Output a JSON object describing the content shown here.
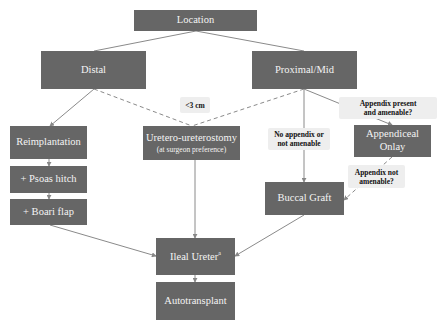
{
  "diagram": {
    "type": "flowchart",
    "colors": {
      "node_fill": "#666666",
      "node_text": "#f4f4f4",
      "label_fill": "#eeeeee",
      "edge": "#888888"
    },
    "nodes": {
      "location": {
        "label": "Location"
      },
      "distal": {
        "label": "Distal"
      },
      "proximal_mid": {
        "label": "Proximal/Mid"
      },
      "reimplantation": {
        "label": "Reimplantation"
      },
      "psoas_hitch": {
        "label": "+ Psoas hitch"
      },
      "boari_flap": {
        "label": "+ Boari flap"
      },
      "uretero_ureterostomy": {
        "label": "Uretero-ureterostomy",
        "sublabel": "(at surgeon preference)"
      },
      "appendiceal_onlay": {
        "label_line1": "Appendiceal",
        "label_line2": "Onlay"
      },
      "buccal_graft": {
        "label": "Buccal Graft"
      },
      "ileal_ureter": {
        "label": "Ileal Ureter",
        "superscript": "a"
      },
      "autotransplant": {
        "label": "Autotransplant"
      }
    },
    "edge_labels": {
      "lt3cm": {
        "text": "<3 cm"
      },
      "appendix_present": {
        "line1": "Appendix present",
        "line2": "and amenable?"
      },
      "no_appendix": {
        "line1": "No appendix or",
        "line2": "not amenable"
      },
      "appendix_not_amenable": {
        "line1": "Appendix not",
        "line2": "amenable?"
      }
    },
    "edges": [
      {
        "from": "Location",
        "to": "Distal",
        "style": "solid"
      },
      {
        "from": "Location",
        "to": "Proximal/Mid",
        "style": "solid"
      },
      {
        "from": "Distal",
        "to": "Reimplantation",
        "style": "solid"
      },
      {
        "from": "Distal",
        "to": "Uretero-ureterostomy",
        "style": "dashed",
        "label": "<3 cm"
      },
      {
        "from": "Proximal/Mid",
        "to": "Uretero-ureterostomy",
        "style": "dashed",
        "label": "<3 cm"
      },
      {
        "from": "Proximal/Mid",
        "to": "Appendiceal Onlay",
        "style": "solid",
        "label": "Appendix present and amenable?"
      },
      {
        "from": "Proximal/Mid",
        "to": "Buccal Graft",
        "style": "solid",
        "label": "No appendix or not amenable"
      },
      {
        "from": "Appendiceal Onlay",
        "to": "Buccal Graft",
        "style": "dashed",
        "label": "Appendix not amenable?"
      },
      {
        "from": "Reimplantation",
        "to": "+ Psoas hitch",
        "style": "solid"
      },
      {
        "from": "+ Psoas hitch",
        "to": "+ Boari flap",
        "style": "solid"
      },
      {
        "from": "+ Boari flap",
        "to": "Ileal Ureter",
        "style": "solid"
      },
      {
        "from": "Uretero-ureterostomy",
        "to": "Ileal Ureter",
        "style": "solid"
      },
      {
        "from": "Buccal Graft",
        "to": "Ileal Ureter",
        "style": "solid"
      },
      {
        "from": "Ileal Ureter",
        "to": "Autotransplant",
        "style": "solid"
      }
    ]
  }
}
